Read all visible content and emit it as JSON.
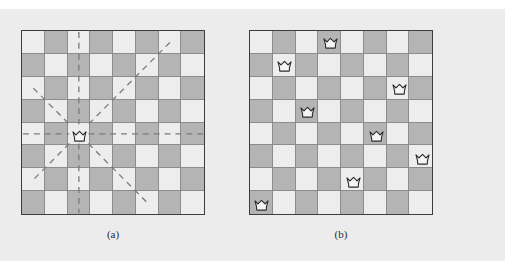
{
  "figure": {
    "background_color": "#ececec",
    "page_color": "#ffffff"
  },
  "board_style": {
    "size": 8,
    "light_square_color": "#ededed",
    "dark_square_color": "#b4b4b4",
    "border_color": "#3d3d3d",
    "grid_line_color": "#8c8c8c",
    "queen_fill": "#f5f5f5",
    "queen_stroke": "#2b2b2b",
    "ray_color": "#7a7a7a",
    "first_square_shade": "light"
  },
  "panels": [
    {
      "id": "a",
      "caption": "(a)",
      "description": "Single queen with dashed attack rays along row, column and both diagonals",
      "queens": [
        {
          "row": 5,
          "col": 3
        }
      ],
      "rays": [
        {
          "direction": "horizontal"
        },
        {
          "direction": "vertical"
        },
        {
          "direction": "diagonal-down-right"
        },
        {
          "direction": "diagonal-down-left"
        }
      ]
    },
    {
      "id": "b",
      "caption": "(b)",
      "description": "A complete solution to the eight queens problem",
      "solution_columns": [
        4,
        2,
        7,
        3,
        6,
        8,
        5,
        1
      ],
      "queens": [
        {
          "row": 1,
          "col": 4
        },
        {
          "row": 2,
          "col": 2
        },
        {
          "row": 3,
          "col": 7
        },
        {
          "row": 4,
          "col": 3
        },
        {
          "row": 5,
          "col": 6
        },
        {
          "row": 6,
          "col": 8
        },
        {
          "row": 7,
          "col": 5
        },
        {
          "row": 8,
          "col": 1
        }
      ],
      "rays": []
    }
  ]
}
